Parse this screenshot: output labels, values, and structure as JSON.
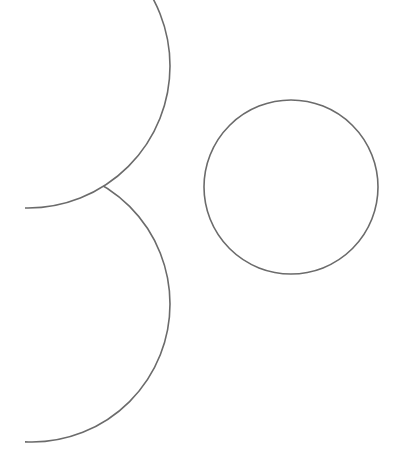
{
  "canvas": {
    "width": 395,
    "height": 466,
    "background": "#ffffff"
  },
  "style": {
    "stroke": "#6b6b6b",
    "stroke_width": 1.6,
    "clip_left_x": 25
  },
  "shapes": [
    {
      "name": "top-left-circle",
      "cx": 28,
      "cy": 66,
      "r": 142,
      "clipped": true
    },
    {
      "name": "bottom-left-circle",
      "cx": 32,
      "cy": 304,
      "r": 138,
      "clipped": true,
      "occluded_by": "top-left-circle"
    },
    {
      "name": "right-circle",
      "cx": 291,
      "cy": 187,
      "r": 87,
      "clipped": false
    }
  ]
}
